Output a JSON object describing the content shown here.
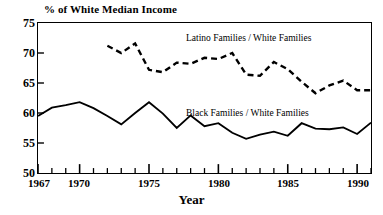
{
  "chart_data": {
    "type": "line",
    "title": "",
    "xlabel": "Year",
    "ylabel": "% of White Median Income",
    "xlim": [
      1967,
      1991
    ],
    "ylim": [
      50,
      75
    ],
    "ytick_values": [
      75,
      70,
      65,
      60,
      55,
      50
    ],
    "ytick_labels": [
      "75",
      "70",
      "65",
      "60",
      "55",
      "50"
    ],
    "xtick_values": [
      1967,
      1970,
      1975,
      1980,
      1985,
      1990
    ],
    "xtick_labels": [
      "1967",
      "1970",
      "1975",
      "1980",
      "1985",
      "1990"
    ],
    "xtick_minor_step": 1,
    "grid": false,
    "legend_position": "inline-annotation",
    "series": [
      {
        "name": "Latino Families / White Families",
        "style": "dashed",
        "color": "#000000",
        "annotation": "Latino Families / White Families",
        "x": [
          1972,
          1973,
          1974,
          1975,
          1976,
          1977,
          1978,
          1979,
          1980,
          1981,
          1982,
          1983,
          1984,
          1985,
          1986,
          1987,
          1988,
          1989,
          1990,
          1991
        ],
        "values": [
          71.2,
          70.0,
          71.6,
          67.2,
          66.8,
          68.4,
          68.2,
          69.2,
          69.0,
          70.0,
          66.4,
          66.2,
          68.5,
          67.3,
          65.2,
          63.3,
          64.6,
          65.4,
          63.8,
          63.8
        ]
      },
      {
        "name": "Black Families / White Families",
        "style": "solid",
        "color": "#000000",
        "annotation": "Black Families / White Families",
        "x": [
          1967,
          1968,
          1969,
          1970,
          1971,
          1972,
          1973,
          1974,
          1975,
          1976,
          1977,
          1978,
          1979,
          1980,
          1981,
          1982,
          1983,
          1984,
          1985,
          1986,
          1987,
          1988,
          1989,
          1990,
          1991
        ],
        "values": [
          59.5,
          60.9,
          61.3,
          61.8,
          60.8,
          59.5,
          58.1,
          60.0,
          61.8,
          59.9,
          57.5,
          59.6,
          57.8,
          58.3,
          56.7,
          55.7,
          56.4,
          56.9,
          56.2,
          58.3,
          57.4,
          57.3,
          57.6,
          56.5,
          58.4
        ]
      }
    ]
  }
}
